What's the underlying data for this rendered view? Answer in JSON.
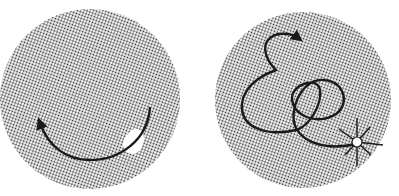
{
  "figure": {
    "panels": [
      {
        "id": "left",
        "description": "Stippled circular field with a curved arc trajectory ending in an arrow; a small white blob on the arc at lower right",
        "circle": {
          "cx": 90,
          "cy": 99,
          "r": 90
        },
        "path_type": "arc"
      },
      {
        "id": "right",
        "description": "Stippled circular field with a looping, tangled trajectory ending in an arrow at top; a white spot with radiating lines at lower right",
        "circle": {
          "cx": 303,
          "cy": 100,
          "r": 88
        },
        "path_type": "looping"
      }
    ],
    "colors": {
      "background": "#ffffff",
      "stipple": "#2a2a2a",
      "stroke": "#1a1a1a",
      "highlight": "#ffffff"
    }
  }
}
